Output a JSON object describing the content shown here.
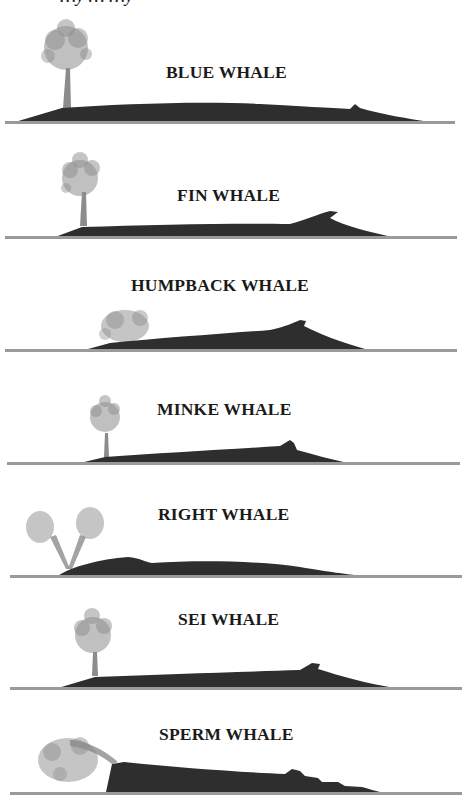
{
  "header": {
    "clipped_caption": "…y … …y"
  },
  "colors": {
    "body": "#2e2e2e",
    "spray": "#8c8c8c",
    "waterline": "#9a9a9a",
    "text": "#1a1a1a"
  },
  "whales": [
    {
      "name": "BLUE WHALE",
      "spout": "tall-column"
    },
    {
      "name": "FIN WHALE",
      "spout": "tall-column"
    },
    {
      "name": "HUMPBACK WHALE",
      "spout": "low-bushy"
    },
    {
      "name": "MINKE WHALE",
      "spout": "small-column"
    },
    {
      "name": "RIGHT WHALE",
      "spout": "v-shaped"
    },
    {
      "name": "SEI WHALE",
      "spout": "tall-column"
    },
    {
      "name": "SPERM WHALE",
      "spout": "angled-forward"
    }
  ]
}
